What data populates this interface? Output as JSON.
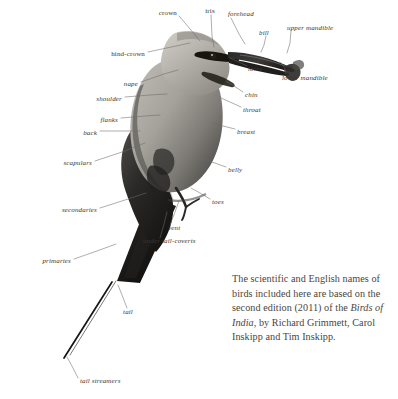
{
  "figure": {
    "kind": "bird-topography-diagram",
    "background_color": "#ffffff",
    "label_color": "#3a3632",
    "leader_line_color": "#6e6a66",
    "caption_color": "#4a4540",
    "plumage_dark": "#1d1b19",
    "plumage_mid": "#8d8a85",
    "plumage_light": "#c9c6c0"
  },
  "labels": [
    {
      "id": "crown",
      "text": "crown",
      "x": 177,
      "y": 13,
      "anchor": "end"
    },
    {
      "id": "iris",
      "text": "iris",
      "x": 210,
      "y": 11,
      "anchor": "middle"
    },
    {
      "id": "forehead",
      "text": "forehead",
      "x": 228,
      "y": 14,
      "anchor": "start"
    },
    {
      "id": "bill",
      "text": "bill",
      "x": 264,
      "y": 33,
      "anchor": "middle"
    },
    {
      "id": "upper-mandible",
      "text": "upper mandible",
      "x": 287,
      "y": 28,
      "anchor": "start"
    },
    {
      "id": "lower-mandible",
      "text": "lower mandible",
      "x": 282,
      "y": 78,
      "anchor": "start"
    },
    {
      "id": "lores",
      "text": "lores",
      "x": 248,
      "y": 69,
      "anchor": "start"
    },
    {
      "id": "hind-crown",
      "text": "hind-crown",
      "x": 145,
      "y": 54,
      "anchor": "end"
    },
    {
      "id": "nape",
      "text": "nape",
      "x": 138,
      "y": 84,
      "anchor": "end"
    },
    {
      "id": "shoulder",
      "text": "shoulder",
      "x": 122,
      "y": 99,
      "anchor": "end"
    },
    {
      "id": "flanks",
      "text": "flanks",
      "x": 118,
      "y": 120,
      "anchor": "end"
    },
    {
      "id": "back",
      "text": "back",
      "x": 97,
      "y": 133,
      "anchor": "end"
    },
    {
      "id": "scapulars",
      "text": "scapulars",
      "x": 92,
      "y": 163,
      "anchor": "end"
    },
    {
      "id": "chin",
      "text": "chin",
      "x": 245,
      "y": 95,
      "anchor": "start"
    },
    {
      "id": "throat",
      "text": "throat",
      "x": 243,
      "y": 110,
      "anchor": "start"
    },
    {
      "id": "breast",
      "text": "breast",
      "x": 237,
      "y": 132,
      "anchor": "start"
    },
    {
      "id": "belly",
      "text": "belly",
      "x": 228,
      "y": 170,
      "anchor": "start"
    },
    {
      "id": "toes",
      "text": "toes",
      "x": 212,
      "y": 202,
      "anchor": "start"
    },
    {
      "id": "vent",
      "text": "vent",
      "x": 168,
      "y": 228,
      "anchor": "start"
    },
    {
      "id": "under-tail-coverts",
      "text": "under tail-coverts",
      "x": 143,
      "y": 241,
      "anchor": "start"
    },
    {
      "id": "secondaries",
      "text": "secondaries",
      "x": 97,
      "y": 210,
      "anchor": "end"
    },
    {
      "id": "primaries",
      "text": "primaries",
      "x": 71,
      "y": 261,
      "anchor": "end"
    },
    {
      "id": "tail",
      "text": "tail",
      "x": 128,
      "y": 312,
      "anchor": "middle"
    },
    {
      "id": "tail-streamers",
      "text": "tail streamers",
      "x": 80,
      "y": 381,
      "anchor": "start"
    }
  ],
  "leaders": [
    {
      "id": "crown",
      "points": "179,16 191,30 200,41"
    },
    {
      "id": "iris",
      "points": "211,15 212,36 214,47"
    },
    {
      "id": "forehead",
      "points": "231,18 239,34 245,44"
    },
    {
      "id": "bill",
      "points": "266,36 264,45 261,52"
    },
    {
      "id": "upper-mandible",
      "points": "291,31 290,43 287,53"
    },
    {
      "id": "lower-mandible",
      "points": "286,73 284,67 280,62"
    },
    {
      "id": "lores",
      "points": "247,66 239,62 230,58"
    },
    {
      "id": "hind-crown",
      "points": "148,52 176,46 190,43"
    },
    {
      "id": "nape",
      "points": "141,82 164,74 178,70"
    },
    {
      "id": "shoulder",
      "points": "125,97 150,95 167,94"
    },
    {
      "id": "flanks",
      "points": "121,118 145,116 160,115"
    },
    {
      "id": "back",
      "points": "100,131 124,131 140,131"
    },
    {
      "id": "scapulars",
      "points": "95,161 122,152 145,143"
    },
    {
      "id": "chin",
      "points": "243,92 234,86 226,81"
    },
    {
      "id": "throat",
      "points": "241,107 230,102 221,98"
    },
    {
      "id": "breast",
      "points": "235,129 223,126 212,123"
    },
    {
      "id": "belly",
      "points": "226,167 212,162 199,157"
    },
    {
      "id": "toes",
      "points": "210,199 200,193 191,188"
    },
    {
      "id": "vent",
      "points": "170,225 175,212 179,201"
    },
    {
      "id": "under-tail-coverts",
      "points": "160,238 164,224 167,212"
    },
    {
      "id": "secondaries",
      "points": "100,208 125,200 146,193"
    },
    {
      "id": "primaries",
      "points": "74,259 97,251 116,244"
    },
    {
      "id": "tail",
      "points": "127,308 122,295 118,285"
    },
    {
      "id": "tail-streamers",
      "points": "78,378 73,368 67,357"
    }
  ],
  "caption": {
    "line1": "The scientific and English names of",
    "line2": "birds included here are based on the",
    "line3a": "second edition (2011) of the ",
    "line3b": "Birds of",
    "line4a": "India",
    "line4b": ", by Richard Grimmett, Carol",
    "line5": "Inskipp and Tim Inskipp."
  }
}
